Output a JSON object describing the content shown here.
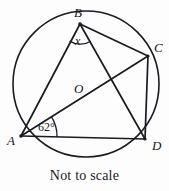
{
  "figure": {
    "caption": "Not to scale",
    "stroke_color": "#1a1a20",
    "background_color": "#fdfdfd",
    "circle": {
      "cx": 86,
      "cy": 84,
      "r": 73
    },
    "points": [
      {
        "id": "A",
        "label": "A",
        "x": 21,
        "y": 136,
        "label_x": 7,
        "label_y": 134
      },
      {
        "id": "B",
        "label": "B",
        "x": 80,
        "y": 24,
        "label_x": 74,
        "label_y": 6
      },
      {
        "id": "C",
        "label": "C",
        "x": 148,
        "y": 56,
        "label_x": 154,
        "label_y": 41
      },
      {
        "id": "D",
        "label": "D",
        "x": 145,
        "y": 139,
        "label_x": 152,
        "label_y": 139
      },
      {
        "id": "O",
        "label": "O",
        "x": 86,
        "y": 84,
        "label_x": 74,
        "label_y": 82
      }
    ],
    "segments": [
      {
        "name": "chord-AB",
        "from": "A",
        "to": "B"
      },
      {
        "name": "diameter-AC",
        "from": "A",
        "to": "C"
      },
      {
        "name": "chord-AD",
        "from": "A",
        "to": "D"
      },
      {
        "name": "chord-BC",
        "from": "B",
        "to": "C"
      },
      {
        "name": "chord-BD",
        "from": "B",
        "to": "D"
      },
      {
        "name": "chord-CD",
        "from": "C",
        "to": "D"
      }
    ],
    "angles": [
      {
        "name": "angle-at-B",
        "label": "x",
        "vertex": "B",
        "label_x": 75,
        "label_y": 35,
        "arc_radius": 20
      },
      {
        "name": "angle-at-A",
        "label": "62°",
        "vertex": "A",
        "label_x": 38,
        "label_y": 121,
        "arc_radius": 36
      }
    ]
  }
}
